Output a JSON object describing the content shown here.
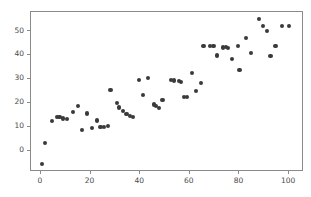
{
  "chart_data": {
    "type": "scatter",
    "title": "",
    "xlabel": "",
    "ylabel": "",
    "xlim": [
      -4,
      106
    ],
    "ylim": [
      -9,
      58
    ],
    "xticks": [
      0,
      20,
      40,
      60,
      80,
      100
    ],
    "yticks": [
      0,
      10,
      20,
      30,
      40,
      50
    ],
    "grid": false,
    "legend": null,
    "marker_color": "#3a3a3a",
    "marker_size": 4.2,
    "axes_color": "#8a8a8a",
    "background": "#ffffff",
    "series": [
      {
        "name": "observations",
        "points": [
          [
            0.5,
            -5.5
          ],
          [
            1.5,
            3.3
          ],
          [
            4.5,
            12.4
          ],
          [
            6.5,
            14.2
          ],
          [
            7.5,
            14.0
          ],
          [
            9.0,
            13.4
          ],
          [
            10.5,
            13.3
          ],
          [
            13.0,
            16.2
          ],
          [
            15.0,
            18.8
          ],
          [
            16.5,
            8.5
          ],
          [
            18.5,
            15.5
          ],
          [
            20.5,
            9.5
          ],
          [
            22.5,
            12.6
          ],
          [
            24.0,
            9.8
          ],
          [
            25.5,
            10.0
          ],
          [
            27.0,
            10.2
          ],
          [
            28.0,
            25.3
          ],
          [
            30.5,
            19.9
          ],
          [
            31.5,
            18.0
          ],
          [
            33.0,
            16.6
          ],
          [
            34.5,
            15.4
          ],
          [
            36.0,
            14.3
          ],
          [
            37.0,
            14.0
          ],
          [
            39.5,
            29.5
          ],
          [
            41.0,
            23.1
          ],
          [
            43.0,
            30.3
          ],
          [
            45.5,
            19.3
          ],
          [
            46.5,
            18.8
          ],
          [
            47.5,
            17.9
          ],
          [
            49.0,
            21.3
          ],
          [
            52.5,
            29.5
          ],
          [
            53.5,
            29.3
          ],
          [
            55.5,
            29.0
          ],
          [
            56.5,
            28.8
          ],
          [
            57.5,
            22.4
          ],
          [
            59.0,
            22.3
          ],
          [
            61.0,
            32.5
          ],
          [
            62.5,
            24.8
          ],
          [
            64.5,
            28.1
          ],
          [
            65.5,
            43.8
          ],
          [
            68.0,
            43.7
          ],
          [
            69.5,
            43.6
          ],
          [
            71.0,
            39.8
          ],
          [
            73.5,
            43.1
          ],
          [
            74.5,
            43.2
          ],
          [
            75.5,
            42.9
          ],
          [
            77.0,
            38.3
          ],
          [
            79.5,
            43.7
          ],
          [
            80.0,
            33.7
          ],
          [
            82.5,
            47.0
          ],
          [
            84.5,
            40.8
          ],
          [
            88.0,
            55.0
          ],
          [
            89.5,
            52.3
          ],
          [
            91.0,
            50.2
          ],
          [
            92.5,
            39.7
          ],
          [
            94.5,
            43.9
          ],
          [
            97.0,
            52.0
          ],
          [
            100.0,
            52.2
          ]
        ]
      }
    ]
  }
}
